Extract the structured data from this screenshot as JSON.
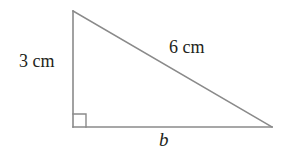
{
  "figure": {
    "type": "right-triangle-diagram",
    "background_color": "#ffffff",
    "stroke_color": "#8a8a8a",
    "text_color": "#231f20",
    "vertices": {
      "apex": [
        73,
        11
      ],
      "right_angle": [
        73,
        127
      ],
      "base_right": [
        272,
        127
      ]
    },
    "right_angle_marker": {
      "size": 13,
      "present": true
    },
    "labels": {
      "vertical_leg": "3 cm",
      "hypotenuse": "6 cm",
      "base": "b"
    }
  }
}
